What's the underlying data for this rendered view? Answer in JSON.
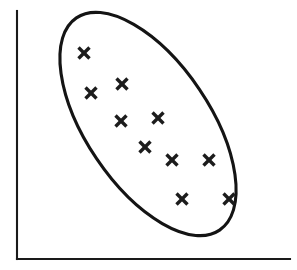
{
  "figure": {
    "width": 297,
    "height": 270,
    "background_color": "#ffffff",
    "ink_color": "#1a1a1a"
  },
  "chart_data": {
    "type": "scatter",
    "title": "",
    "subtitle": "",
    "xlabel": "",
    "ylabel": "",
    "grid": false,
    "legend": null,
    "axis_ticks": {
      "x": [],
      "y": []
    },
    "axes_style": "two-sided-open-corner",
    "xlim": [
      0,
      100
    ],
    "ylim": [
      0,
      100
    ],
    "series": [
      {
        "name": "observations",
        "marker": "x",
        "marker_color": "#1c1c1c",
        "points": [
          {
            "label": "p1",
            "x": 24.5,
            "y": 83.1
          },
          {
            "label": "p2",
            "x": 27.1,
            "y": 66.9
          },
          {
            "label": "p3",
            "x": 38.5,
            "y": 70.6
          },
          {
            "label": "p4",
            "x": 38.1,
            "y": 55.6
          },
          {
            "label": "p5",
            "x": 51.6,
            "y": 57.0
          },
          {
            "label": "p6",
            "x": 46.9,
            "y": 45.2
          },
          {
            "label": "p7",
            "x": 56.8,
            "y": 39.9
          },
          {
            "label": "p8",
            "x": 70.3,
            "y": 39.9
          },
          {
            "label": "p9",
            "x": 60.4,
            "y": 24.2
          },
          {
            "label": "p10",
            "x": 77.7,
            "y": 24.2
          }
        ]
      }
    ],
    "annotations": [
      {
        "kind": "ellipse",
        "name": "confidence-ellipse",
        "center": {
          "x": 53.7,
          "y": 54.4
        },
        "semi_major": 128,
        "semi_minor": 62,
        "rotation_deg": 56,
        "stroke_color": "#141414",
        "fill": "none",
        "description": "hand-drawn ellipse enclosing all data points, tilted downward left-to-right indicating negative correlation"
      }
    ],
    "pixel_geometry": {
      "y_axis": {
        "x": 17,
        "y_top": 11,
        "y_bottom": 259
      },
      "x_axis": {
        "y": 259,
        "x_left": 17,
        "x_right": 290
      },
      "plot_origin": {
        "x": 17,
        "y": 259
      },
      "plot_extent": {
        "width": 273,
        "height": 248
      },
      "markers_px": [
        {
          "cx": 84,
          "cy": 53,
          "size": 11
        },
        {
          "cx": 91,
          "cy": 93,
          "size": 11
        },
        {
          "cx": 122,
          "cy": 84,
          "size": 11
        },
        {
          "cx": 121,
          "cy": 121,
          "size": 11
        },
        {
          "cx": 158,
          "cy": 118,
          "size": 11
        },
        {
          "cx": 145,
          "cy": 147,
          "size": 11
        },
        {
          "cx": 172,
          "cy": 160,
          "size": 11
        },
        {
          "cx": 209,
          "cy": 160,
          "size": 11
        },
        {
          "cx": 182,
          "cy": 199,
          "size": 11
        },
        {
          "cx": 229,
          "cy": 199,
          "size": 11
        }
      ],
      "ellipse_px": {
        "cx": 148,
        "cy": 124,
        "rx": 128,
        "ry": 62,
        "rotation_deg": 56
      }
    }
  }
}
